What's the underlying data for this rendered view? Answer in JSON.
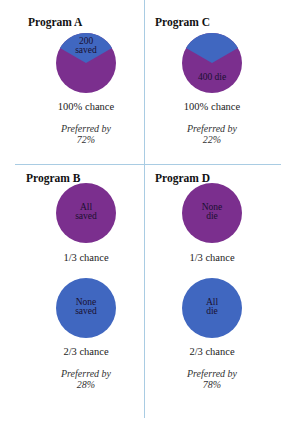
{
  "colors": {
    "saved_or_blue": "#4067c0",
    "die_or_purple": "#7b2f8e",
    "divider": "#a9cce3"
  },
  "programs": {
    "A": {
      "title": "Program A",
      "outcomes": [
        {
          "label_line1": "200",
          "label_line2": "saved",
          "pie": "1/3 blue wedge top, 2/3 purple",
          "chance": "100% chance"
        }
      ],
      "preferred_by_label": "Preferred by",
      "preferred_by_value": "72%"
    },
    "C": {
      "title": "Program C",
      "outcomes": [
        {
          "label_line1": "400 die",
          "pie": "1/3 blue wedge top, 2/3 purple",
          "chance": "100% chance"
        }
      ],
      "preferred_by_label": "Preferred by",
      "preferred_by_value": "22%"
    },
    "B": {
      "title": "Program B",
      "outcomes": [
        {
          "label_line1": "All",
          "label_line2": "saved",
          "pie": "full purple",
          "chance": "1/3 chance"
        },
        {
          "label_line1": "None",
          "label_line2": "saved",
          "pie": "full blue",
          "chance": "2/3 chance"
        }
      ],
      "preferred_by_label": "Preferred by",
      "preferred_by_value": "28%"
    },
    "D": {
      "title": "Program D",
      "outcomes": [
        {
          "label_line1": "None",
          "label_line2": "die",
          "pie": "full purple",
          "chance": "1/3 chance"
        },
        {
          "label_line1": "All",
          "label_line2": "die",
          "pie": "full blue",
          "chance": "2/3 chance"
        }
      ],
      "preferred_by_label": "Preferred by",
      "preferred_by_value": "78%"
    }
  }
}
